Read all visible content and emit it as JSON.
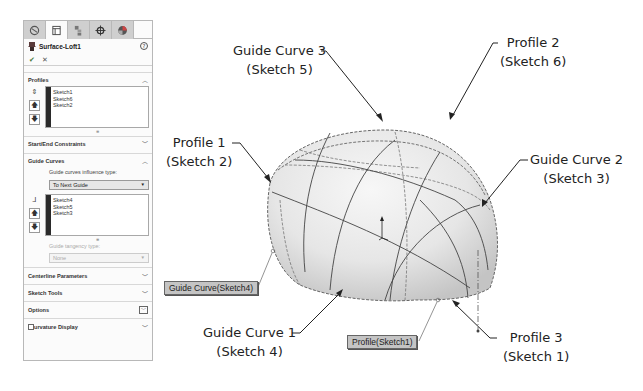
{
  "panel": {
    "tabs": [
      {
        "icon": "feature-manager-icon",
        "active": false
      },
      {
        "icon": "property-manager-icon",
        "active": true
      },
      {
        "icon": "configuration-manager-icon",
        "active": false
      },
      {
        "icon": "dimxpert-icon",
        "active": false
      },
      {
        "icon": "display-manager-icon",
        "active": false
      }
    ],
    "feature_title": "Surface-Loft1",
    "help_glyph": "?",
    "ok_glyph": "✔",
    "cancel_glyph": "✕",
    "sections": {
      "profiles": {
        "label": "Profiles",
        "items": [
          "Sketch1",
          "Sketch6",
          "Sketch2"
        ]
      },
      "start_end": {
        "label": "Start/End Constraints"
      },
      "guide_curves": {
        "label": "Guide Curves",
        "influence_label": "Guide curves influence type:",
        "influence_value": "To Next Guide",
        "items": [
          "Sketch4",
          "Sketch5",
          "Sketch3"
        ],
        "tangency_label": "Guide tangency type:",
        "tangency_value": "None"
      },
      "centerline": {
        "label": "Centerline Parameters"
      },
      "sketch_tools": {
        "label": "Sketch Tools"
      },
      "options": {
        "label": "Options"
      },
      "curvature": {
        "label": "urvature Display"
      }
    }
  },
  "viewport": {
    "callouts": {
      "guide3": {
        "line1": "Guide Curve 3",
        "line2": "(Sketch 5)"
      },
      "profile2": {
        "line1": "Profile 2",
        "line2": "(Sketch 6)"
      },
      "profile1": {
        "line1": "Profile 1",
        "line2": "(Sketch 2)"
      },
      "guide2": {
        "line1": "Guide Curve 2",
        "line2": "(Sketch 3)"
      },
      "guide1": {
        "line1": "Guide Curve 1",
        "line2": "(Sketch 4)"
      },
      "profile3": {
        "line1": "Profile 3",
        "line2": "(Sketch 1)"
      }
    },
    "tags": {
      "guide_tag": "Guide Curve(Sketch4)",
      "profile_tag": "Profile(Sketch1)"
    }
  }
}
